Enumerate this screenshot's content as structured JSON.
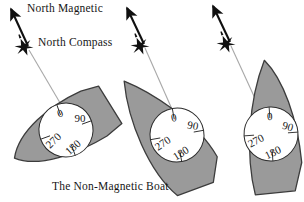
{
  "figure": {
    "title": "The Non-Magnetic Boat",
    "labels": {
      "north_magnetic": "North Magnetic",
      "north_compass": "North Compass",
      "caption": "The Non-Magnetic Boat"
    },
    "colors": {
      "hull_fill": "#9a9a9a",
      "hull_stroke": "#3c3c3c",
      "compass_fill": "#ffffff",
      "compass_stroke": "#2b2b2b",
      "arrow": "#101010",
      "lubber_line": "#a8a8a8",
      "text": "#161616",
      "background": "#ffffff"
    },
    "compass_rose": {
      "marks": [
        {
          "value": "0",
          "bearing": 0
        },
        {
          "value": "90",
          "bearing": 90
        },
        {
          "value": "180",
          "bearing": 180
        },
        {
          "value": "270",
          "bearing": 270
        }
      ]
    },
    "boats": [
      {
        "id": "boat-left",
        "heading_label": "heading-left",
        "hull_rotation_deg": -28,
        "compass_rotation_deg": -20
      },
      {
        "id": "boat-middle",
        "heading_label": "heading-middle",
        "hull_rotation_deg": -12,
        "compass_rotation_deg": -10
      },
      {
        "id": "boat-right",
        "heading_label": "heading-right",
        "hull_rotation_deg": -2,
        "compass_rotation_deg": -4
      }
    ],
    "north_markers": [
      {
        "id": "marker-left",
        "arrow_from": [
          30,
          48
        ],
        "arrow_to": [
          10,
          6
        ]
      },
      {
        "id": "marker-middle",
        "arrow_from": [
          146,
          46
        ],
        "arrow_to": [
          126,
          5
        ]
      },
      {
        "id": "marker-right",
        "arrow_from": [
          232,
          44
        ],
        "arrow_to": [
          212,
          4
        ]
      }
    ]
  }
}
